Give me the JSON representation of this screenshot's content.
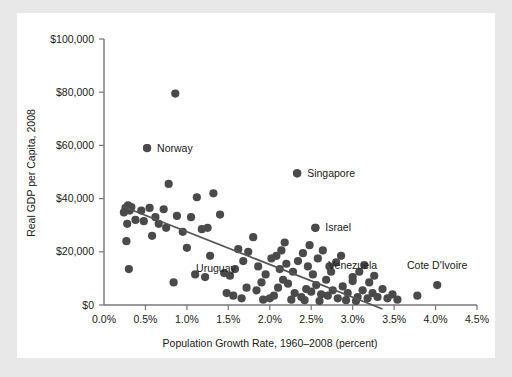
{
  "figure": {
    "background_color": "#e8e8e8",
    "panel_color": "#ffffff",
    "point_color": "#4a4a4a",
    "axis_color": "#777777",
    "trend_color": "#555555"
  },
  "chart_data": {
    "type": "scatter",
    "title": "",
    "xlabel": "Population Growth Rate, 1960–2008 (percent)",
    "ylabel": "Real GDP per Capita, 2008",
    "xlim": [
      0.0,
      4.5
    ],
    "ylim": [
      0,
      100000
    ],
    "grid": false,
    "legend": "none",
    "xticks": [
      0.0,
      0.5,
      1.0,
      1.5,
      2.0,
      2.5,
      3.0,
      3.5,
      4.0,
      4.5
    ],
    "xtick_labels": [
      "0.0%",
      "0.5%",
      "1.0%",
      "1.5%",
      "2.0%",
      "2.5%",
      "3.0%",
      "3.5%",
      "4.0%",
      "4.5%"
    ],
    "yticks": [
      0,
      20000,
      40000,
      60000,
      80000,
      100000
    ],
    "ytick_labels": [
      "$0",
      "$20,000",
      "$40,000",
      "$60,000",
      "$80,000",
      "$100,000"
    ],
    "trend_line": {
      "x": [
        0.23,
        3.36
      ],
      "y": [
        37000,
        -1500
      ],
      "description": "downward-sloping fitted regression line"
    },
    "annotations": [
      {
        "label": "Norway",
        "x": 0.52,
        "y": 59000,
        "marker": true,
        "label_dx": 10,
        "label_dy": 3.5
      },
      {
        "label": "Singapore",
        "x": 2.33,
        "y": 49500,
        "marker": true,
        "label_dx": 10,
        "label_dy": 3.5
      },
      {
        "label": "Israel",
        "x": 2.55,
        "y": 29000,
        "marker": true,
        "label_dx": 10,
        "label_dy": 3.5
      },
      {
        "label": "Uruguay",
        "x": 1.35,
        "y": 12500,
        "marker": false,
        "label_dx": 0,
        "label_dy": 0
      },
      {
        "label": "Venezuela",
        "x": 3.0,
        "y": 13500,
        "marker": false,
        "label_dx": 0,
        "label_dy": 0
      },
      {
        "label": "Cote D'Ivoire",
        "x": 4.02,
        "y": 13500,
        "marker": false,
        "label_dx": 0,
        "label_dy": 0
      }
    ],
    "points": [
      {
        "x": 0.26,
        "y": 36500
      },
      {
        "x": 0.29,
        "y": 37500
      },
      {
        "x": 0.31,
        "y": 35500
      },
      {
        "x": 0.24,
        "y": 34800
      },
      {
        "x": 0.33,
        "y": 36800
      },
      {
        "x": 0.28,
        "y": 30500
      },
      {
        "x": 0.27,
        "y": 24000
      },
      {
        "x": 0.3,
        "y": 13500
      },
      {
        "x": 0.52,
        "y": 59000
      },
      {
        "x": 0.86,
        "y": 79500
      },
      {
        "x": 0.45,
        "y": 35500
      },
      {
        "x": 0.55,
        "y": 36500
      },
      {
        "x": 0.48,
        "y": 31500
      },
      {
        "x": 0.62,
        "y": 33000
      },
      {
        "x": 0.72,
        "y": 36000
      },
      {
        "x": 0.78,
        "y": 45500
      },
      {
        "x": 0.66,
        "y": 30500
      },
      {
        "x": 0.75,
        "y": 29000
      },
      {
        "x": 0.88,
        "y": 33500
      },
      {
        "x": 0.95,
        "y": 27500
      },
      {
        "x": 0.84,
        "y": 8500
      },
      {
        "x": 1.05,
        "y": 33000
      },
      {
        "x": 1.12,
        "y": 40500
      },
      {
        "x": 1.18,
        "y": 28500
      },
      {
        "x": 1.25,
        "y": 29000
      },
      {
        "x": 1.32,
        "y": 42000
      },
      {
        "x": 1.4,
        "y": 34000
      },
      {
        "x": 1.1,
        "y": 11500
      },
      {
        "x": 1.22,
        "y": 10500
      },
      {
        "x": 1.45,
        "y": 12000
      },
      {
        "x": 1.52,
        "y": 11000
      },
      {
        "x": 1.58,
        "y": 13500
      },
      {
        "x": 1.62,
        "y": 21000
      },
      {
        "x": 1.68,
        "y": 16500
      },
      {
        "x": 1.74,
        "y": 20000
      },
      {
        "x": 1.8,
        "y": 25500
      },
      {
        "x": 1.72,
        "y": 6500
      },
      {
        "x": 1.84,
        "y": 5500
      },
      {
        "x": 1.9,
        "y": 8500
      },
      {
        "x": 1.95,
        "y": 11500
      },
      {
        "x": 2.02,
        "y": 17500
      },
      {
        "x": 2.08,
        "y": 18500
      },
      {
        "x": 2.14,
        "y": 20500
      },
      {
        "x": 2.2,
        "y": 15500
      },
      {
        "x": 2.05,
        "y": 3500
      },
      {
        "x": 2.1,
        "y": 6500
      },
      {
        "x": 2.16,
        "y": 9500
      },
      {
        "x": 2.22,
        "y": 8000
      },
      {
        "x": 2.28,
        "y": 12500
      },
      {
        "x": 2.33,
        "y": 49500
      },
      {
        "x": 2.34,
        "y": 16500
      },
      {
        "x": 2.4,
        "y": 19500
      },
      {
        "x": 2.46,
        "y": 14500
      },
      {
        "x": 2.52,
        "y": 11500
      },
      {
        "x": 2.55,
        "y": 29000
      },
      {
        "x": 2.58,
        "y": 17500
      },
      {
        "x": 2.64,
        "y": 20500
      },
      {
        "x": 2.3,
        "y": 4500
      },
      {
        "x": 2.38,
        "y": 3000
      },
      {
        "x": 2.44,
        "y": 6000
      },
      {
        "x": 2.5,
        "y": 5000
      },
      {
        "x": 2.56,
        "y": 7500
      },
      {
        "x": 2.62,
        "y": 4000
      },
      {
        "x": 2.68,
        "y": 9500
      },
      {
        "x": 2.74,
        "y": 12500
      },
      {
        "x": 2.8,
        "y": 16000
      },
      {
        "x": 2.86,
        "y": 18500
      },
      {
        "x": 2.7,
        "y": 3500
      },
      {
        "x": 2.76,
        "y": 5500
      },
      {
        "x": 2.82,
        "y": 2500
      },
      {
        "x": 2.88,
        "y": 7000
      },
      {
        "x": 2.94,
        "y": 4500
      },
      {
        "x": 3.0,
        "y": 9000
      },
      {
        "x": 3.0,
        "y": 10500
      },
      {
        "x": 3.06,
        "y": 3000
      },
      {
        "x": 3.12,
        "y": 5500
      },
      {
        "x": 3.08,
        "y": 12500
      },
      {
        "x": 3.14,
        "y": 15000
      },
      {
        "x": 3.18,
        "y": 2500
      },
      {
        "x": 3.24,
        "y": 4500
      },
      {
        "x": 3.2,
        "y": 8500
      },
      {
        "x": 3.3,
        "y": 3000
      },
      {
        "x": 3.36,
        "y": 6000
      },
      {
        "x": 3.42,
        "y": 2500
      },
      {
        "x": 3.48,
        "y": 4000
      },
      {
        "x": 3.54,
        "y": 2000
      },
      {
        "x": 3.78,
        "y": 3500
      },
      {
        "x": 4.02,
        "y": 7500
      },
      {
        "x": 1.92,
        "y": 2000
      },
      {
        "x": 2.0,
        "y": 2500
      },
      {
        "x": 2.26,
        "y": 2000
      },
      {
        "x": 2.42,
        "y": 1800
      },
      {
        "x": 2.6,
        "y": 1500
      },
      {
        "x": 2.92,
        "y": 1800
      },
      {
        "x": 3.04,
        "y": 1500
      },
      {
        "x": 2.48,
        "y": 22500
      },
      {
        "x": 2.18,
        "y": 23500
      },
      {
        "x": 1.86,
        "y": 14500
      },
      {
        "x": 1.48,
        "y": 4500
      },
      {
        "x": 1.56,
        "y": 3500
      },
      {
        "x": 1.66,
        "y": 2500
      },
      {
        "x": 0.38,
        "y": 32000
      },
      {
        "x": 0.58,
        "y": 26000
      },
      {
        "x": 1.0,
        "y": 21500
      },
      {
        "x": 1.28,
        "y": 18500
      },
      {
        "x": 2.12,
        "y": 13500
      },
      {
        "x": 2.72,
        "y": 14500
      },
      {
        "x": 3.26,
        "y": 11000
      }
    ]
  }
}
